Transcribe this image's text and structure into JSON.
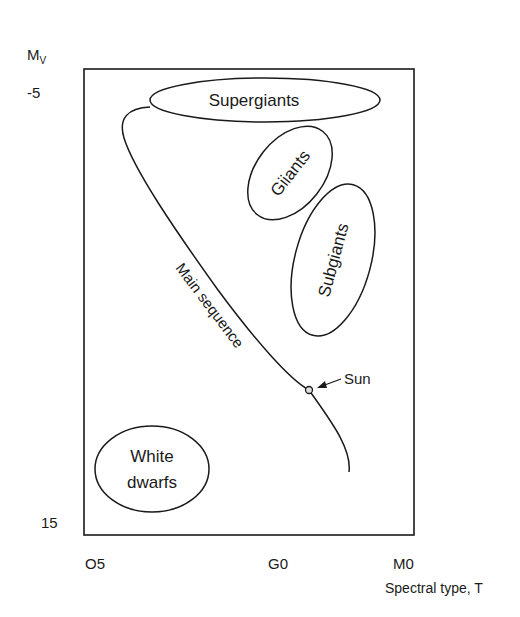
{
  "diagram": {
    "y_axis": {
      "label_main": "M",
      "label_sub": "V",
      "ticks": [
        {
          "label": "-5"
        },
        {
          "label": "15"
        }
      ]
    },
    "x_axis": {
      "label": "Spectral type, T",
      "ticks": [
        {
          "label": "O5"
        },
        {
          "label": "G0"
        },
        {
          "label": "M0"
        }
      ]
    },
    "regions": {
      "supergiants": "Supergiants",
      "giants": "Giiants",
      "subgiants": "Subgiants",
      "white_dwarfs_line1": "White",
      "white_dwarfs_line2": "dwarfs"
    },
    "main_sequence_label": "Main sequence",
    "sun_label": "Sun"
  },
  "colors": {
    "ink": "#1a1a1a",
    "background": "#ffffff"
  }
}
